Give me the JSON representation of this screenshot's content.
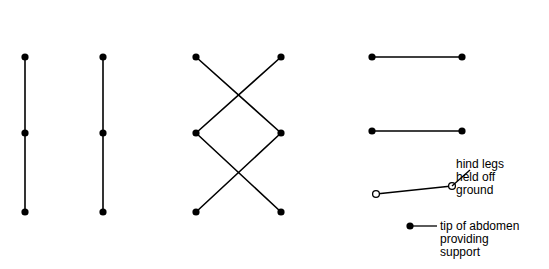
{
  "figure": {
    "background_color": "#ffffff",
    "ink_color": "#000000"
  },
  "panels": [
    {
      "letter": "A",
      "genus": "PERIPLANETA",
      "speed": "very slow",
      "letter_pos": [
        63,
        9
      ],
      "genus_pos": [
        97,
        10
      ],
      "speed_pos": [
        31,
        33
      ],
      "nodes": [
        {
          "label": "6",
          "x": 25,
          "y": 57,
          "label_side": "left",
          "filled": true
        },
        {
          "label": "5",
          "x": 25,
          "y": 133,
          "label_side": "left",
          "filled": true
        },
        {
          "label": "4",
          "x": 25,
          "y": 212,
          "label_side": "left",
          "filled": true
        },
        {
          "label": "3",
          "x": 103,
          "y": 57,
          "label_side": "right",
          "filled": true
        },
        {
          "label": "2",
          "x": 103,
          "y": 133,
          "label_side": "right",
          "filled": true
        },
        {
          "label": "1",
          "x": 103,
          "y": 212,
          "label_side": "right",
          "filled": true
        }
      ],
      "edges": [
        [
          0,
          1
        ],
        [
          1,
          2
        ],
        [
          3,
          4
        ],
        [
          4,
          5
        ]
      ]
    },
    {
      "letter": "B",
      "genus": "",
      "speed": "normal",
      "letter_pos": [
        232,
        9
      ],
      "genus_pos": null,
      "speed_pos": [
        216,
        33
      ],
      "nodes": [
        {
          "label": "1",
          "x": 196,
          "y": 57,
          "label_side": "left",
          "filled": true
        },
        {
          "label": "5",
          "x": 196,
          "y": 133,
          "label_side": "left",
          "filled": true
        },
        {
          "label": "3",
          "x": 196,
          "y": 212,
          "label_side": "left",
          "filled": true
        },
        {
          "label": "4",
          "x": 281,
          "y": 57,
          "label_side": "right",
          "filled": true
        },
        {
          "label": "2",
          "x": 281,
          "y": 133,
          "label_side": "right",
          "filled": true
        },
        {
          "label": "6",
          "x": 281,
          "y": 212,
          "label_side": "right",
          "filled": true
        }
      ],
      "edges": [
        [
          0,
          4
        ],
        [
          3,
          1
        ],
        [
          1,
          5
        ],
        [
          4,
          2
        ]
      ]
    },
    {
      "letter": "C",
      "genus": "TROPIDOPOLA",
      "speed": "fast",
      "letter_pos": [
        347,
        9
      ],
      "genus_pos": [
        368,
        10
      ],
      "speed_pos": [
        407,
        33
      ],
      "nodes": [
        {
          "label": "1",
          "x": 372,
          "y": 57,
          "label_side": "left",
          "filled": true
        },
        {
          "label": "1",
          "x": 462,
          "y": 57,
          "label_side": "right",
          "filled": true
        },
        {
          "label": "2",
          "x": 372,
          "y": 131,
          "label_side": "left",
          "filled": true
        },
        {
          "label": "2",
          "x": 462,
          "y": 131,
          "label_side": "right",
          "filled": true
        },
        {
          "label": "",
          "x": 376,
          "y": 194,
          "label_side": "none",
          "filled": false
        },
        {
          "label": "",
          "x": 452,
          "y": 186,
          "label_side": "none",
          "filled": false
        },
        {
          "label": "",
          "x": 410,
          "y": 226,
          "label_side": "none",
          "filled": true
        }
      ],
      "edges": [
        [
          0,
          1
        ],
        [
          2,
          3
        ],
        [
          4,
          5
        ]
      ]
    }
  ],
  "annotations": [
    {
      "name": "hind-legs-note",
      "lines": [
        "hind legs",
        "held off",
        "ground"
      ],
      "text_pos": [
        456,
        158
      ],
      "leader": [
        [
          452,
          186
        ],
        [
          470,
          170
        ]
      ]
    },
    {
      "name": "abdomen-tip-note",
      "lines": [
        "tip of abdomen",
        "providing",
        "support"
      ],
      "text_pos": [
        440,
        220
      ],
      "leader": [
        [
          410,
          226
        ],
        [
          437,
          226
        ]
      ]
    }
  ]
}
